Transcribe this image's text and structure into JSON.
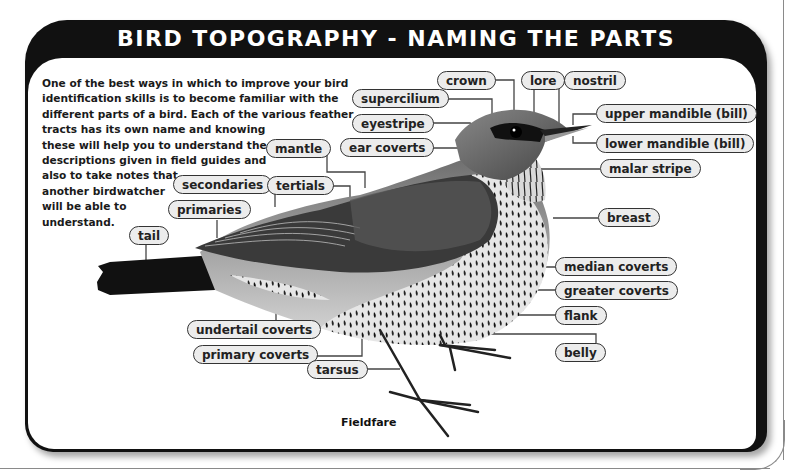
{
  "title": "BIRD TOPOGRAPHY - NAMING THE PARTS",
  "intro_lines": [
    "One of the best ways in which to improve your bird",
    "identification skills is to become familiar with the",
    "different parts of a bird. Each of the various feather",
    "tracts has its own name and knowing",
    "these will help you to understand the",
    "descriptions given in field guides and",
    "also to take notes that",
    "another birdwatcher",
    "will be able to",
    "understand."
  ],
  "labels": {
    "crown": "crown",
    "lore": "lore",
    "nostril": "nostril",
    "supercilium": "supercilium",
    "upper_mandible": "upper mandible (bill)",
    "eyestripe": "eyestripe",
    "lower_mandible": "lower mandible (bill)",
    "mantle": "mantle",
    "ear_coverts": "ear coverts",
    "malar_stripe": "malar stripe",
    "secondaries": "secondaries",
    "tertials": "tertials",
    "primaries": "primaries",
    "breast": "breast",
    "tail": "tail",
    "median_coverts": "median coverts",
    "greater_coverts": "greater coverts",
    "flank": "flank",
    "undertail_coverts": "undertail coverts",
    "belly": "belly",
    "primary_coverts": "primary coverts",
    "tarsus": "tarsus"
  },
  "caption": "Fieldfare",
  "colors": {
    "frame": "#111111",
    "pill_fill": "#ececec",
    "pill_border": "#333333",
    "text": "#1a1a1a"
  }
}
